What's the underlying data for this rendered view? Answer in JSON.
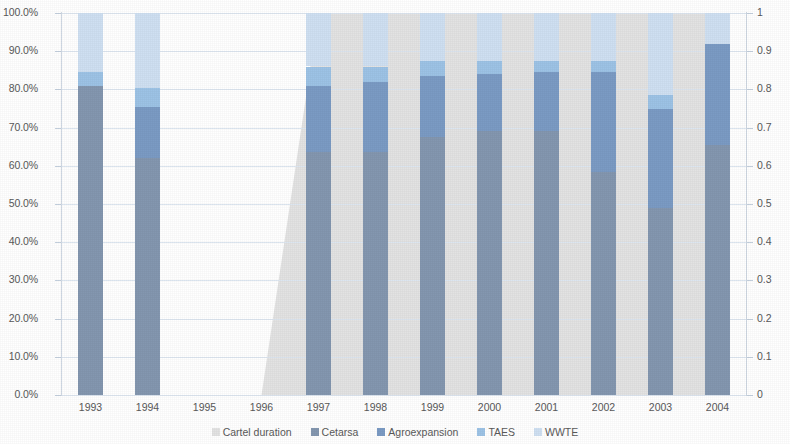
{
  "chart_data": {
    "type": "bar",
    "subtype": "stacked-100-percent-with-area",
    "title": "",
    "xlabel": "",
    "ylabel": "",
    "categories": [
      "1993",
      "1994",
      "1995",
      "1996",
      "1997",
      "1998",
      "1999",
      "2000",
      "2001",
      "2002",
      "2003",
      "2004"
    ],
    "y_left": {
      "ticks": [
        "0.0%",
        "10.0%",
        "20.0%",
        "30.0%",
        "40.0%",
        "50.0%",
        "60.0%",
        "70.0%",
        "80.0%",
        "90.0%",
        "100.0%"
      ],
      "values": [
        0,
        10,
        20,
        30,
        40,
        50,
        60,
        70,
        80,
        90,
        100
      ],
      "min": 0,
      "max": 100,
      "unit": "%"
    },
    "y_right": {
      "ticks": [
        "0",
        "0.1",
        "0.2",
        "0.3",
        "0.4",
        "0.5",
        "0.6",
        "0.7",
        "0.8",
        "0.9",
        "1"
      ],
      "values": [
        0,
        0.1,
        0.2,
        0.3,
        0.4,
        0.5,
        0.6,
        0.7,
        0.8,
        0.9,
        1
      ],
      "min": 0,
      "max": 1
    },
    "grid": true,
    "legend_position": "bottom",
    "series": [
      {
        "name": "Cetarsa",
        "color": "#8497b0",
        "values": [
          81.0,
          62.0,
          null,
          null,
          63.5,
          63.5,
          67.5,
          69.0,
          69.0,
          58.5,
          49.0,
          65.5
        ]
      },
      {
        "name": "Agroexpansion",
        "color": "#7b9bc4",
        "values": [
          0.0,
          13.5,
          null,
          null,
          17.5,
          18.5,
          16.0,
          15.0,
          15.5,
          26.0,
          26.0,
          26.5
        ]
      },
      {
        "name": "TAES",
        "color": "#9dc3e6",
        "values": [
          3.5,
          5.0,
          null,
          null,
          5.0,
          4.0,
          4.0,
          3.5,
          3.0,
          3.0,
          3.5,
          0.0
        ]
      },
      {
        "name": "WWTE",
        "color": "#cfe0f2",
        "values": [
          15.5,
          19.5,
          null,
          null,
          14.0,
          14.0,
          12.5,
          12.5,
          12.5,
          12.5,
          21.5,
          8.0
        ]
      }
    ],
    "area_series": {
      "name": "Cartel duration",
      "color": "#e3e3e3",
      "axis": "right",
      "points": [
        {
          "x": "1996",
          "y": 0
        },
        {
          "x": "1997",
          "y": 1
        },
        {
          "x": "2004",
          "y": 1
        }
      ]
    }
  },
  "legend": {
    "items": [
      {
        "label": "Cartel duration",
        "color": "#e3e3e3"
      },
      {
        "label": "Cetarsa",
        "color": "#8497b0"
      },
      {
        "label": "Agroexpansion",
        "color": "#7b9bc4"
      },
      {
        "label": "TAES",
        "color": "#9dc3e6"
      },
      {
        "label": "WWTE",
        "color": "#cfe0f2"
      }
    ]
  },
  "colors": {
    "background": "#ffffff",
    "gridline": "#dde6f0",
    "axis_text": "#595959",
    "plot_border": "#cfd8e3"
  }
}
